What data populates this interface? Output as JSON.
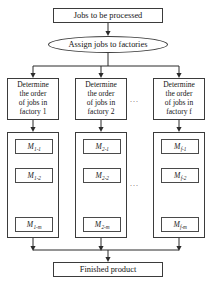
{
  "diagram": {
    "type": "flowchart",
    "background_color": "#ffffff",
    "line_color": "#3b3b3b",
    "text_color": "#141414"
  },
  "start_node": {
    "label": "Jobs to be processed",
    "shape": "rectangle"
  },
  "assign_node": {
    "label": "Assign jobs to factories",
    "shape": "oval"
  },
  "columns": [
    {
      "determine": {
        "line1": "Determine",
        "line2": "the order",
        "line3": "of jobs in",
        "line4": "factory 1"
      },
      "machines": [
        {
          "base": "M",
          "sub": "1-1"
        },
        {
          "base": "M",
          "sub": "1-2"
        },
        {
          "base": "M",
          "sub": "1-m"
        }
      ]
    },
    {
      "determine": {
        "line1": "Determine",
        "line2": "the order",
        "line3": "of jobs in",
        "line4": "factory 2"
      },
      "machines": [
        {
          "base": "M",
          "sub": "2-1"
        },
        {
          "base": "M",
          "sub": "2-2"
        },
        {
          "base": "M",
          "sub": "2-m"
        }
      ]
    },
    {
      "determine": {
        "line1": "Determine",
        "line2": "the order",
        "line3": "of jobs in",
        "line4": "factory f"
      },
      "machines": [
        {
          "base": "M",
          "sub": "f-1"
        },
        {
          "base": "M",
          "sub": "f-2"
        },
        {
          "base": "M",
          "sub": "f-m"
        }
      ]
    }
  ],
  "ellipses": {
    "between_columns_top": "...",
    "between_columns_bottom": "...",
    "vertical_machines": "vertical-dotted"
  },
  "end_node": {
    "label": "Finished product",
    "shape": "rectangle"
  }
}
